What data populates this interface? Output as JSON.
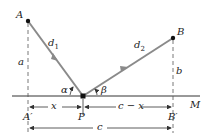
{
  "diagram": {
    "points": {
      "A": {
        "label": "A",
        "x": 28,
        "y": 21
      },
      "B": {
        "label": "B",
        "x": 173,
        "y": 38
      },
      "P": {
        "label": "P",
        "x": 83,
        "y": 96
      },
      "A_prime": {
        "label": "A′",
        "x": 28,
        "y": 96
      },
      "B_prime": {
        "label": "B′",
        "x": 173,
        "y": 96
      }
    },
    "mirror_line": {
      "label": "M"
    },
    "segments": {
      "d1": {
        "label": "d",
        "sub": "1"
      },
      "d2": {
        "label": "d",
        "sub": "2"
      },
      "a": {
        "label": "a"
      },
      "b": {
        "label": "b"
      }
    },
    "angles": {
      "alpha": {
        "label": "α"
      },
      "beta": {
        "label": "β"
      }
    },
    "dimensions": {
      "x": {
        "label": "x"
      },
      "c_minus_x": {
        "label": "c − x"
      },
      "c": {
        "label": "c"
      }
    },
    "colors": {
      "path": "#8a8a8a",
      "line": "#333333",
      "text": "#222222"
    }
  }
}
